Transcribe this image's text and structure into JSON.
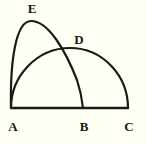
{
  "figure": {
    "background_color": "#fffff4",
    "stroke_color": "#1a1a16",
    "stroke_width": 2.2,
    "label_color": "#1a1a16",
    "canvas": {
      "width": 146,
      "height": 144
    }
  },
  "labels": {
    "a": "A",
    "b": "B",
    "c": "C",
    "d": "D",
    "e": "E"
  },
  "points": {
    "A": {
      "x": 11,
      "y": 108
    },
    "B": {
      "x": 83,
      "y": 108
    },
    "C": {
      "x": 128,
      "y": 108
    },
    "D": {
      "x": 72,
      "y": 50
    },
    "E": {
      "x": 31,
      "y": 21
    }
  },
  "label_positions": {
    "A": {
      "x": 5,
      "y": 120
    },
    "B": {
      "x": 76,
      "y": 120
    },
    "C": {
      "x": 121,
      "y": 120
    },
    "D": {
      "x": 71,
      "y": 33
    },
    "E": {
      "x": 24,
      "y": 2
    }
  },
  "geometry": {
    "baseline": {
      "name": "baseline-AC",
      "from": "A",
      "to": "C",
      "y": 108,
      "x_start": 11,
      "x_end": 128
    },
    "arc_large": {
      "name": "semicircle-AC",
      "from": "A",
      "to": "C",
      "apex": {
        "x": 70,
        "y": 48
      },
      "path": "M 11 108 C 11 76 37 48 70 48 C 103 48 128 76 128 108"
    },
    "arc_small": {
      "name": "arc-AEB",
      "from": "A",
      "through": "E",
      "to": "B",
      "apex": {
        "x": 31,
        "y": 21
      },
      "path": "M 11 108 C 10 60 16 21 31 21 C 49 21 66 52 77 80 C 80 89 82 99 83 108"
    }
  }
}
